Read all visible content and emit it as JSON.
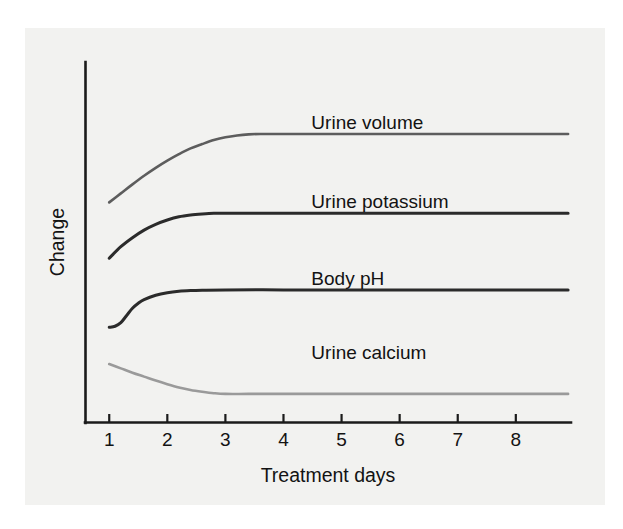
{
  "figure": {
    "background_color": "#ffffff",
    "panel_color": "#f2f2f0",
    "axis_color": "#1b1b1b",
    "text_color": "#131313"
  },
  "chart_data": {
    "type": "line",
    "title": "",
    "subtitle": "",
    "xlabel": "Treatment days",
    "ylabel": "Change",
    "xlim": [
      0.6,
      8.95
    ],
    "ylim": [
      0,
      1
    ],
    "grid": false,
    "legend_position": "inline-right",
    "x_ticks": [
      "1",
      "2",
      "3",
      "4",
      "5",
      "6",
      "7",
      "8"
    ],
    "x_tick_values": [
      1,
      2,
      3,
      4,
      5,
      6,
      7,
      8
    ],
    "y_ticks": [],
    "y_tick_values": [],
    "annotations": [],
    "series": [
      {
        "name": "Urine volume",
        "color": "#5d5d5d",
        "stroke_width": 2.6,
        "label_x": 4.48,
        "label_y": 0.815,
        "start_value": 0.61,
        "plateau_value": 0.8,
        "direction": "increase",
        "x": [
          1.0,
          1.2,
          1.4,
          1.6,
          1.8,
          2.0,
          2.2,
          2.4,
          2.6,
          2.8,
          3.0,
          3.2,
          3.4,
          3.6,
          4.0,
          5.0,
          6.0,
          7.0,
          8.0,
          8.9
        ],
        "values": [
          0.61,
          0.635,
          0.66,
          0.684,
          0.706,
          0.726,
          0.744,
          0.76,
          0.772,
          0.783,
          0.791,
          0.796,
          0.799,
          0.8,
          0.8,
          0.8,
          0.8,
          0.8,
          0.8,
          0.8
        ]
      },
      {
        "name": "Urine potassium",
        "color": "#2b2b2b",
        "stroke_width": 3.0,
        "label_x": 4.48,
        "label_y": 0.595,
        "start_value": 0.455,
        "plateau_value": 0.58,
        "direction": "increase",
        "x": [
          1.0,
          1.2,
          1.4,
          1.6,
          1.8,
          2.0,
          2.2,
          2.4,
          2.6,
          2.8,
          3.0,
          3.4,
          4.0,
          5.0,
          6.0,
          7.0,
          8.0,
          8.9
        ],
        "values": [
          0.455,
          0.487,
          0.512,
          0.533,
          0.549,
          0.561,
          0.57,
          0.575,
          0.578,
          0.58,
          0.58,
          0.58,
          0.58,
          0.58,
          0.58,
          0.58,
          0.58,
          0.58
        ]
      },
      {
        "name": "Body pH",
        "color": "#2b2b2b",
        "stroke_width": 3.0,
        "label_x": 4.48,
        "label_y": 0.38,
        "start_value": 0.263,
        "plateau_value": 0.367,
        "direction": "increase-sigmoid",
        "x": [
          1.0,
          1.1,
          1.2,
          1.3,
          1.4,
          1.5,
          1.6,
          1.8,
          2.0,
          2.2,
          2.4,
          2.6,
          3.0,
          4.0,
          5.0,
          6.0,
          7.0,
          8.0,
          8.9
        ],
        "values": [
          0.263,
          0.266,
          0.276,
          0.296,
          0.316,
          0.33,
          0.34,
          0.352,
          0.359,
          0.363,
          0.365,
          0.366,
          0.367,
          0.367,
          0.367,
          0.367,
          0.367,
          0.367,
          0.367
        ]
      },
      {
        "name": "Urine calcium",
        "color": "#9a9a9a",
        "stroke_width": 2.6,
        "label_x": 4.48,
        "label_y": 0.175,
        "start_value": 0.161,
        "plateau_value": 0.078,
        "direction": "decrease",
        "x": [
          1.0,
          1.2,
          1.4,
          1.6,
          1.8,
          2.0,
          2.2,
          2.4,
          2.6,
          2.8,
          3.0,
          3.4,
          4.0,
          5.0,
          6.0,
          7.0,
          8.0,
          8.9
        ],
        "values": [
          0.161,
          0.149,
          0.137,
          0.126,
          0.115,
          0.105,
          0.096,
          0.089,
          0.084,
          0.08,
          0.078,
          0.078,
          0.078,
          0.078,
          0.078,
          0.078,
          0.078,
          0.078
        ]
      }
    ]
  }
}
